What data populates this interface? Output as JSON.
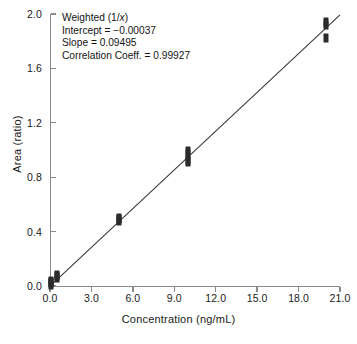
{
  "chart_data": {
    "type": "scatter",
    "title": "",
    "xlabel": "Concentration (ng/mL)",
    "ylabel": "Area (ratio)",
    "xlim": [
      0.0,
      21.0
    ],
    "ylim": [
      0.0,
      2.0
    ],
    "xticks": [
      "0.0",
      "3.0",
      "6.0",
      "9.0",
      "12.0",
      "15.0",
      "18.0",
      "21.0"
    ],
    "xtick_values": [
      0.0,
      3.0,
      6.0,
      9.0,
      12.0,
      15.0,
      18.0,
      21.0
    ],
    "yticks": [
      "0.0",
      "0.4",
      "0.8",
      "1.2",
      "1.6",
      "2.0"
    ],
    "ytick_values": [
      0.0,
      0.4,
      0.8,
      1.2,
      1.6,
      2.0
    ],
    "grid": false,
    "legend": false,
    "marker_color": "#2b2b2b",
    "line_color": "#3a3a3a",
    "axis_color": "#8a8a8a",
    "series": [
      {
        "name": "Calibration standards",
        "x": [
          0.1,
          0.1,
          0.1,
          0.1,
          0.5,
          0.5,
          0.5,
          5.0,
          5.0,
          5.0,
          10.0,
          10.0,
          10.0,
          10.0,
          20.0,
          20.0,
          20.0
        ],
        "y": [
          0.01,
          0.02,
          0.03,
          0.04,
          0.06,
          0.07,
          0.08,
          0.48,
          0.49,
          0.5,
          0.91,
          0.93,
          0.97,
          0.99,
          1.82,
          1.92,
          1.94
        ]
      }
    ],
    "fit_line": {
      "name": "Weighted linear regression",
      "x": [
        0.0,
        21.0
      ],
      "y": [
        -0.00037,
        1.99358
      ]
    }
  },
  "annotation": {
    "line1_prefix": "Weighted (1/",
    "line1_italic": "x",
    "line1_suffix": ")",
    "line2": "Intercept = −0.00037",
    "line3": "Slope = 0.09495",
    "line4": "Correlation Coeff. = 0.99927"
  }
}
